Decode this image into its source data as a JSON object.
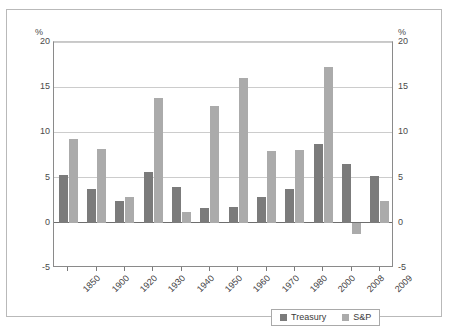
{
  "chart_data": {
    "type": "bar",
    "title": "",
    "xlabel": "",
    "ylabel": "%",
    "ylabel_right": "%",
    "ylim": [
      -5,
      20
    ],
    "yticks": [
      20,
      15,
      10,
      5,
      0,
      -5
    ],
    "ytick_labels": [
      "20",
      "15",
      "10",
      "5",
      "0",
      "-5"
    ],
    "grid": true,
    "legend_position": "bottom-right",
    "categories": [
      "1850",
      "1900",
      "1920",
      "1930",
      "1940",
      "1950",
      "1960",
      "1970",
      "1980",
      "2000",
      "2008",
      "2009"
    ],
    "series": [
      {
        "name": "Treasury",
        "color": "#7b7b7b",
        "values": [
          5.3,
          3.7,
          2.4,
          5.6,
          4.0,
          1.6,
          1.7,
          2.9,
          3.7,
          8.7,
          6.5,
          5.2
        ]
      },
      {
        "name": "S&P",
        "color": "#ababab",
        "values": [
          9.3,
          8.2,
          2.8,
          13.8,
          1.2,
          12.9,
          16.0,
          7.9,
          8.1,
          17.2,
          -1.2,
          2.4
        ]
      }
    ]
  },
  "legend": {
    "items": [
      {
        "label": "Treasury",
        "swatch": "treasury"
      },
      {
        "label": "S&P",
        "swatch": "snp"
      }
    ]
  }
}
